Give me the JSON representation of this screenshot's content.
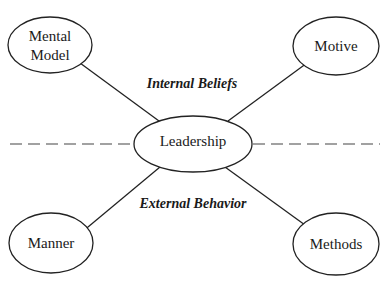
{
  "diagram": {
    "type": "hub-and-spoke",
    "center": {
      "label": "Leadership"
    },
    "nodes": [
      {
        "id": "mental-model",
        "lines": [
          "Mental",
          "Model"
        ],
        "position": "top-left"
      },
      {
        "id": "motive",
        "lines": [
          "Motive"
        ],
        "position": "top-right"
      },
      {
        "id": "manner",
        "lines": [
          "Manner"
        ],
        "position": "bottom-left"
      },
      {
        "id": "methods",
        "lines": [
          "Methods"
        ],
        "position": "bottom-right"
      }
    ],
    "regions": {
      "upper": "Internal Beliefs",
      "lower": "External Behavior"
    },
    "divider": "dashed horizontal line through center"
  }
}
